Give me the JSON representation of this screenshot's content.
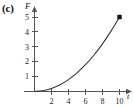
{
  "panel": {
    "label": "(c)"
  },
  "axes": {
    "ylabel": "F",
    "xlabel": "t",
    "x_ticks": [
      "2",
      "4",
      "6",
      "8",
      "10"
    ],
    "y_ticks": [
      "1",
      "2",
      "3",
      "4",
      "5"
    ]
  },
  "chart_data": {
    "type": "line",
    "title": "(c)",
    "xlabel": "t",
    "ylabel": "F",
    "xlim": [
      0,
      11
    ],
    "ylim": [
      0,
      5.6
    ],
    "grid": false,
    "legend": "none",
    "xticks": [
      2,
      4,
      6,
      8,
      10
    ],
    "yticks": [
      1,
      2,
      3,
      4,
      5
    ],
    "series": [
      {
        "name": "F(t)",
        "x": [
          0,
          1,
          2,
          3,
          4,
          5,
          6,
          7,
          8,
          9,
          10
        ],
        "y": [
          0,
          0.05,
          0.2,
          0.45,
          0.8,
          1.25,
          1.8,
          2.45,
          3.2,
          4.05,
          5.0
        ],
        "style": "solid-curve",
        "color": "#333333"
      }
    ],
    "annotations": [
      {
        "name": "endpoint-marker",
        "marker": "filled-square",
        "x": 10,
        "y": 5,
        "color": "#111111"
      }
    ]
  }
}
